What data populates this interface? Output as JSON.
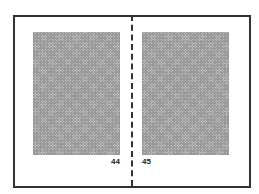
{
  "diagram": {
    "pages": [
      {
        "side": "left",
        "page_number": "44"
      },
      {
        "side": "right",
        "page_number": "45"
      }
    ],
    "colors": {
      "frame": "#333333",
      "text_block": "#bdbdbd"
    }
  }
}
